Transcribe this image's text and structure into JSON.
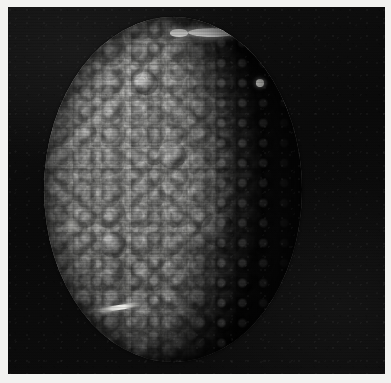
{
  "image": {
    "kind": "spacecraft-photograph",
    "subject": "cratered icy moon",
    "caption": "",
    "orientation": "portrait-crop",
    "medium": "black-and-white photographic print",
    "width_px": 391,
    "height_px": 383
  },
  "frame": {
    "border_color": "#f2f2f0",
    "border_width_px": 8,
    "plate_background_color": "#070707"
  },
  "scene": {
    "background_label": "deep space",
    "background_color": "#0a0a0a",
    "illumination_direction": "upper-left",
    "phase": "gibbous",
    "terminator_side": "right"
  },
  "body": {
    "label": "moon disk",
    "surface_color_light": "#a9a9a6",
    "surface_color_mid": "#878784",
    "surface_color_dark": "#2b2b2a",
    "shadow_color": "#070707",
    "disk_left_px": 36,
    "disk_top_px": 10,
    "disk_width_px": 258,
    "disk_height_px": 345
  },
  "features": [
    {
      "name": "bright-polar-feature",
      "label": "bright elongated deposit near north limb",
      "color": "#ffffff"
    },
    {
      "name": "bright-polar-feature-secondary",
      "label": "smaller bright patch west of main deposit",
      "color": "#ededea"
    },
    {
      "name": "bright-terminator-crater",
      "label": "bright crater on terminator",
      "color": "#cfcfcb"
    },
    {
      "name": "bright-streak",
      "label": "bright linear scarp near lower-left limb",
      "color": "#f2f2ee"
    },
    {
      "name": "bright-limb-patch",
      "label": "diffuse bright patch on left limb",
      "color": "#bdbdb9"
    },
    {
      "name": "crater-a",
      "label": "large crater, central region",
      "color": "#6f6f6d"
    },
    {
      "name": "crater-b",
      "label": "large crater, lower-right of center",
      "color": "#5e5e5c"
    },
    {
      "name": "crater-c",
      "label": "crater, lower-left quadrant",
      "color": "#777775"
    },
    {
      "name": "crater-d",
      "label": "crater, upper-left quadrant",
      "color": "#858583"
    }
  ],
  "texture": {
    "crater_field_label": "dense overlapping crater field",
    "terminator_label": "scalloped crater rims along terminator",
    "scanlines_label": "horizontal scanline striping",
    "grain_label": "film grain"
  }
}
